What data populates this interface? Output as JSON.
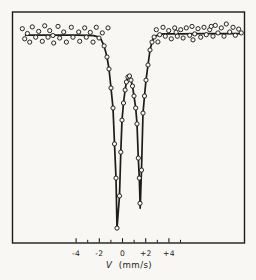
{
  "figure": {
    "background": "#f8f7f3",
    "ink_color": "#1c1c1c",
    "marker": "open-circle"
  },
  "chart_data": {
    "type": "scatter",
    "title": "",
    "xlabel_symbol": "V",
    "xlabel_unit": "(mm/s)",
    "ylabel": "",
    "xlim": [
      -9.5,
      10.5
    ],
    "ylim": [
      0,
      1.08
    ],
    "grid": false,
    "legend": "none",
    "x_major_ticks": [
      {
        "v": -4,
        "label": "-4"
      },
      {
        "v": -2,
        "label": "-2"
      },
      {
        "v": 0,
        "label": "0"
      },
      {
        "v": 2,
        "label": "+2"
      },
      {
        "v": 4,
        "label": "+4"
      }
    ],
    "x_minor_ticks": [
      -3,
      -1,
      1,
      3,
      5
    ],
    "y_axis_note": "relative transmission, unlabeled (baseline = 1.0, deepest dip = 0.0)",
    "fit": {
      "description": "quadrupole doublet absorption fit",
      "dip_centers_mms": [
        -0.5,
        1.5
      ],
      "dip_depths_rel": [
        1.0,
        0.89
      ],
      "curve": [
        [
          -8.35,
          0.997
        ],
        [
          -6.0,
          0.997
        ],
        [
          -4.0,
          0.997
        ],
        [
          -3.0,
          0.996
        ],
        [
          -2.5,
          0.994
        ],
        [
          -2.1,
          0.988
        ],
        [
          -1.85,
          0.975
        ],
        [
          -1.59,
          0.941
        ],
        [
          -1.34,
          0.884
        ],
        [
          -1.16,
          0.822
        ],
        [
          -0.99,
          0.724
        ],
        [
          -0.82,
          0.621
        ],
        [
          -0.69,
          0.436
        ],
        [
          -0.56,
          0.26
        ],
        [
          -0.47,
          0.0
        ],
        [
          -0.26,
          0.168
        ],
        [
          -0.15,
          0.394
        ],
        [
          -0.04,
          0.559
        ],
        [
          0.09,
          0.647
        ],
        [
          0.22,
          0.714
        ],
        [
          0.34,
          0.755
        ],
        [
          0.47,
          0.781
        ],
        [
          0.6,
          0.786
        ],
        [
          0.73,
          0.765
        ],
        [
          0.86,
          0.734
        ],
        [
          0.99,
          0.683
        ],
        [
          1.14,
          0.621
        ],
        [
          1.25,
          0.539
        ],
        [
          1.36,
          0.363
        ],
        [
          1.45,
          0.26
        ],
        [
          1.53,
          0.105
        ],
        [
          1.64,
          0.301
        ],
        [
          1.77,
          0.595
        ],
        [
          1.9,
          0.683
        ],
        [
          2.03,
          0.765
        ],
        [
          2.2,
          0.843
        ],
        [
          2.37,
          0.92
        ],
        [
          2.54,
          0.961
        ],
        [
          2.72,
          0.987
        ],
        [
          3.0,
          0.996
        ],
        [
          3.5,
          1.003
        ],
        [
          5.0,
          1.003
        ],
        [
          7.0,
          1.004
        ],
        [
          10.28,
          1.004
        ]
      ]
    },
    "points": [
      [
        -8.64,
        1.03
      ],
      [
        -8.43,
        0.978
      ],
      [
        -8.2,
        1.005
      ],
      [
        -8.0,
        0.961
      ],
      [
        -7.78,
        1.039
      ],
      [
        -7.48,
        0.986
      ],
      [
        -7.22,
        1.016
      ],
      [
        -6.91,
        0.965
      ],
      [
        -6.71,
        1.045
      ],
      [
        -6.42,
        0.986
      ],
      [
        -6.28,
        1.02
      ],
      [
        -6.0,
        0.995
      ],
      [
        -5.93,
        0.956
      ],
      [
        -5.56,
        1.042
      ],
      [
        -5.41,
        0.982
      ],
      [
        -5.07,
        1.013
      ],
      [
        -4.84,
        0.961
      ],
      [
        -4.41,
        1.037
      ],
      [
        -4.27,
        0.986
      ],
      [
        -3.78,
        1.013
      ],
      [
        -3.69,
        0.965
      ],
      [
        -3.26,
        1.034
      ],
      [
        -3.12,
        0.986
      ],
      [
        -2.78,
        1.011
      ],
      [
        -2.54,
        0.961
      ],
      [
        -2.26,
        1.037
      ],
      [
        -2.03,
        0.982
      ],
      [
        -1.74,
        1.008
      ],
      [
        -1.25,
        1.034
      ],
      [
        -1.59,
        0.941
      ],
      [
        -1.34,
        0.884
      ],
      [
        -1.16,
        0.822
      ],
      [
        -0.99,
        0.724
      ],
      [
        -0.82,
        0.621
      ],
      [
        -0.69,
        0.436
      ],
      [
        -0.56,
        0.26
      ],
      [
        -0.47,
        0.002
      ],
      [
        -0.26,
        0.168
      ],
      [
        -0.15,
        0.394
      ],
      [
        -0.04,
        0.559
      ],
      [
        0.09,
        0.647
      ],
      [
        0.22,
        0.714
      ],
      [
        0.34,
        0.755
      ],
      [
        0.47,
        0.781
      ],
      [
        0.6,
        0.786
      ],
      [
        0.73,
        0.765
      ],
      [
        0.86,
        0.734
      ],
      [
        0.99,
        0.683
      ],
      [
        1.14,
        0.621
      ],
      [
        1.25,
        0.539
      ],
      [
        1.36,
        0.363
      ],
      [
        1.45,
        0.26
      ],
      [
        1.51,
        0.13
      ],
      [
        1.64,
        0.301
      ],
      [
        1.77,
        0.595
      ],
      [
        1.9,
        0.683
      ],
      [
        2.03,
        0.765
      ],
      [
        2.2,
        0.843
      ],
      [
        2.37,
        0.92
      ],
      [
        2.54,
        0.961
      ],
      [
        2.72,
        0.987
      ],
      [
        2.91,
        1.025
      ],
      [
        3.05,
        0.962
      ],
      [
        3.21,
        0.999
      ],
      [
        3.49,
        1.037
      ],
      [
        3.69,
        0.991
      ],
      [
        3.98,
        1.02
      ],
      [
        4.21,
        0.978
      ],
      [
        4.5,
        1.034
      ],
      [
        4.62,
        1.012
      ],
      [
        4.72,
        0.991
      ],
      [
        5.02,
        1.025
      ],
      [
        5.22,
        0.982
      ],
      [
        5.5,
        1.034
      ],
      [
        5.79,
        0.996
      ],
      [
        5.99,
        1.042
      ],
      [
        6.08,
        0.972
      ],
      [
        6.22,
        1.003
      ],
      [
        6.51,
        1.03
      ],
      [
        6.74,
        0.986
      ],
      [
        7.03,
        1.037
      ],
      [
        7.22,
        0.999
      ],
      [
        7.52,
        1.025
      ],
      [
        7.65,
        1.042
      ],
      [
        7.8,
        0.991
      ],
      [
        8.0,
        1.047
      ],
      [
        8.23,
        1.008
      ],
      [
        8.52,
        1.034
      ],
      [
        8.75,
        0.991
      ],
      [
        8.95,
        1.054
      ],
      [
        9.24,
        1.013
      ],
      [
        9.53,
        1.037
      ],
      [
        9.72,
        0.996
      ],
      [
        10.02,
        1.028
      ],
      [
        10.24,
        1.008
      ]
    ],
    "layout": {
      "box": {
        "x": 12.5,
        "y": 12,
        "w": 232,
        "h": 231
      },
      "x0_px": 122.5,
      "px_per_unit": 11.6,
      "baseline_px": 34.5,
      "depth_px": 194,
      "tick_label_y": 255.5,
      "major_tick_len": 4.8,
      "minor_tick_len": 3.2
    }
  }
}
